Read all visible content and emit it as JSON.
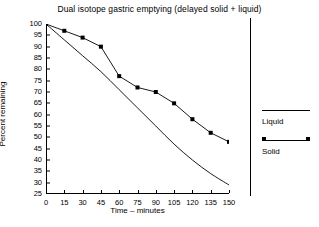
{
  "chart_data": {
    "type": "line",
    "title": "Dual isotope gastric emptying (delayed solid + liquid)",
    "xlabel": "Time – minutes",
    "ylabel": "Percent remaining",
    "xlim": [
      0,
      150
    ],
    "ylim": [
      25,
      100
    ],
    "grid": false,
    "legend_position": "right",
    "xticks": [
      0,
      15,
      30,
      45,
      60,
      75,
      90,
      105,
      120,
      135,
      150
    ],
    "yticks": [
      25,
      30,
      35,
      40,
      45,
      50,
      55,
      60,
      65,
      70,
      75,
      80,
      85,
      90,
      95,
      100
    ],
    "x": [
      0,
      15,
      30,
      45,
      60,
      75,
      90,
      105,
      120,
      135,
      150
    ],
    "series": [
      {
        "name": "Liquid",
        "marker": "none",
        "values": [
          100,
          93,
          86,
          79,
          71,
          63,
          55,
          47,
          40,
          34,
          29
        ]
      },
      {
        "name": "Solid",
        "marker": "square",
        "values": [
          100,
          97,
          94,
          90,
          77,
          72,
          70,
          65,
          58,
          52,
          48
        ]
      }
    ]
  },
  "legend": {
    "items": [
      {
        "label": "Liquid"
      },
      {
        "label": "Solid"
      }
    ]
  },
  "colors": {
    "line": "#000000",
    "background": "#ffffff",
    "axis": "#000000"
  }
}
